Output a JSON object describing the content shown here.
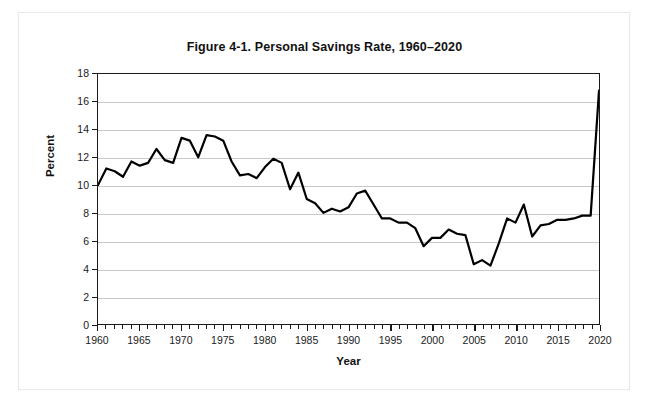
{
  "figure": {
    "title": "Figure 4-1. Personal Savings Rate, 1960–2020"
  },
  "chart_data": {
    "type": "line",
    "title": "Figure 4-1. Personal Savings Rate, 1960–2020",
    "xlabel": "Year",
    "ylabel": "Percent",
    "xlim": [
      1960,
      2020
    ],
    "ylim": [
      0,
      18
    ],
    "ytick_step": 2,
    "xtick_major_step": 5,
    "xtick_minor_step": 1,
    "grid": "horizontal",
    "legend": "none",
    "line_color": "#000000",
    "line_width": 2.2,
    "yticks": [
      0,
      2,
      4,
      6,
      8,
      10,
      12,
      14,
      16,
      18
    ],
    "ytick_labels": [
      "0",
      "2",
      "4",
      "6",
      "8",
      "10",
      "12",
      "14",
      "16",
      "18"
    ],
    "xticks": [
      1960,
      1965,
      1970,
      1975,
      1980,
      1985,
      1990,
      1995,
      2000,
      2005,
      2010,
      2015,
      2020
    ],
    "xtick_labels": [
      "1960",
      "1965",
      "1970",
      "1975",
      "1980",
      "1985",
      "1990",
      "1995",
      "2000",
      "2005",
      "2010",
      "2015",
      "2020"
    ],
    "x": [
      1960,
      1961,
      1962,
      1963,
      1964,
      1965,
      1966,
      1967,
      1968,
      1969,
      1970,
      1971,
      1972,
      1973,
      1974,
      1975,
      1976,
      1977,
      1978,
      1979,
      1980,
      1981,
      1982,
      1983,
      1984,
      1985,
      1986,
      1987,
      1988,
      1989,
      1990,
      1991,
      1992,
      1993,
      1994,
      1995,
      1996,
      1997,
      1998,
      1999,
      2000,
      2001,
      2002,
      2003,
      2004,
      2005,
      2006,
      2007,
      2008,
      2009,
      2010,
      2011,
      2012,
      2013,
      2014,
      2015,
      2016,
      2017,
      2018,
      2019,
      2020
    ],
    "values": [
      10.0,
      11.2,
      11.0,
      10.6,
      11.7,
      11.4,
      11.6,
      12.6,
      11.8,
      11.6,
      13.4,
      13.2,
      12.0,
      13.6,
      13.5,
      13.2,
      11.7,
      10.7,
      10.8,
      10.5,
      11.3,
      11.9,
      11.6,
      9.7,
      10.9,
      9.0,
      8.7,
      8.0,
      8.3,
      8.1,
      8.4,
      9.4,
      9.6,
      8.6,
      7.6,
      7.6,
      7.3,
      7.3,
      6.9,
      5.6,
      6.2,
      6.2,
      6.8,
      6.5,
      6.4,
      4.3,
      4.6,
      4.2,
      5.8,
      7.6,
      7.3,
      8.6,
      6.3,
      7.1,
      7.2,
      7.5,
      7.5,
      7.6,
      7.8,
      7.8,
      16.8
    ]
  }
}
